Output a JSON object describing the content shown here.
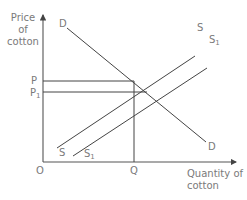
{
  "diagram": {
    "type": "supply-demand",
    "y_axis_label_lines": [
      "Price",
      "of",
      "cotton"
    ],
    "x_axis_label_lines": [
      "Quantity of",
      "cotton"
    ],
    "origin_label": "O",
    "price_labels": {
      "p": "P",
      "p1_base": "P",
      "p1_sub": "1"
    },
    "quantity_label": "Q",
    "curves": {
      "demand_top": "D",
      "demand_bottom": "D",
      "supply_top": "S",
      "supply_bottom": "S",
      "supply1_top_base": "S",
      "supply1_top_sub": "1",
      "supply1_bottom_base": "S",
      "supply1_bottom_sub": "1"
    },
    "colors": {
      "line": "#333333",
      "label": "#7a7a7a",
      "axis": "#555555"
    }
  }
}
